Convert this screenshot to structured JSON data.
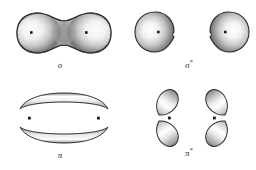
{
  "figure": {
    "background_color": "#ffffff",
    "title": "",
    "panels": [
      {
        "id": "sigma",
        "label": "σ",
        "star": "",
        "orbital_type": "sigma-bonding",
        "description": "peanut-shaped bonding molecular orbital enclosing both nuclei",
        "nuclei_count": 2,
        "lobe_count": 1
      },
      {
        "id": "sigma-star",
        "label": "σ",
        "star": "*",
        "orbital_type": "sigma-antibonding",
        "description": "two separated teardrop lobes with a node between the nuclei",
        "nuclei_count": 2,
        "lobe_count": 2
      },
      {
        "id": "pi",
        "label": "π",
        "star": "",
        "orbital_type": "pi-bonding",
        "description": "two crescent lobes above and below the internuclear axis",
        "nuclei_count": 2,
        "lobe_count": 2
      },
      {
        "id": "pi-star",
        "label": "π",
        "star": "*",
        "orbital_type": "pi-antibonding",
        "description": "four teardrop lobes angled away from the centre in a butterfly pattern",
        "nuclei_count": 2,
        "lobe_count": 4
      }
    ],
    "colors": {
      "outline": "#2e2e2e",
      "shade_dark": "#6f6f6f",
      "shade_mid": "#b8b8b8",
      "highlight": "#ffffff",
      "nucleus": "#1a1a1a",
      "label_text": "#2b2b2b"
    }
  }
}
